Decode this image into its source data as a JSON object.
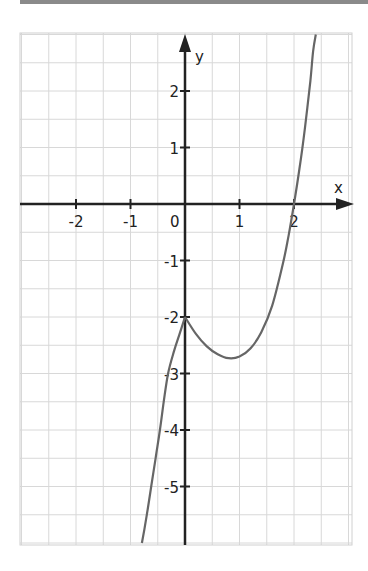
{
  "chart_data": {
    "type": "line",
    "title": "",
    "xlabel": "x",
    "ylabel": "y",
    "xlim": [
      -3,
      2.6
    ],
    "ylim": [
      -6,
      3
    ],
    "grid": true,
    "grid_step": 0.5,
    "x_ticks": [
      {
        "value": -2,
        "label": "-2"
      },
      {
        "value": -1,
        "label": "-1"
      },
      {
        "value": 1,
        "label": "1"
      },
      {
        "value": 2,
        "label": "2"
      }
    ],
    "origin_label": "0",
    "y_ticks": [
      {
        "value": 2,
        "label": "2"
      },
      {
        "value": 1,
        "label": "1"
      },
      {
        "value": -1,
        "label": "-1"
      },
      {
        "value": -2,
        "label": "-2"
      },
      {
        "value": -3,
        "label": "-3"
      },
      {
        "value": -4,
        "label": "-4"
      },
      {
        "value": -5,
        "label": "-5"
      }
    ],
    "series": [
      {
        "name": "f(x)",
        "color": "#666666",
        "points": [
          [
            -0.79,
            -6.0
          ],
          [
            -0.7,
            -5.5
          ],
          [
            -0.62,
            -5.0
          ],
          [
            -0.54,
            -4.5
          ],
          [
            -0.46,
            -4.0
          ],
          [
            -0.39,
            -3.5
          ],
          [
            -0.31,
            -3.0
          ],
          [
            -0.2,
            -2.6
          ],
          [
            -0.1,
            -2.3
          ],
          [
            0,
            -2.0
          ],
          [
            0.2,
            -2.3
          ],
          [
            0.4,
            -2.52
          ],
          [
            0.6,
            -2.66
          ],
          [
            0.8,
            -2.73
          ],
          [
            1.0,
            -2.7
          ],
          [
            1.2,
            -2.56
          ],
          [
            1.4,
            -2.27
          ],
          [
            1.6,
            -1.8
          ],
          [
            1.8,
            -1.04
          ],
          [
            1.9,
            -0.56
          ],
          [
            2.0,
            0
          ],
          [
            2.1,
            0.62
          ],
          [
            2.2,
            1.34
          ],
          [
            2.3,
            2.18
          ],
          [
            2.35,
            2.7
          ],
          [
            2.4,
            3.0
          ]
        ]
      }
    ]
  }
}
